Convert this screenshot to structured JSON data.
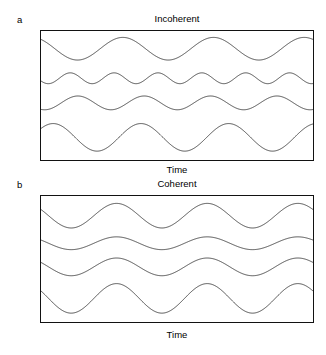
{
  "figure": {
    "background_color": "#ffffff",
    "stroke_color": "#4f4f4f",
    "border_color": "#121212"
  },
  "panels": [
    {
      "letter": "a",
      "title": "Incoherent",
      "xlabel": "Time"
    },
    {
      "letter": "b",
      "title": "Coherent",
      "xlabel": "Time"
    }
  ],
  "chart_data": [
    {
      "type": "line",
      "title": "Incoherent",
      "xlabel": "Time",
      "ylabel": "",
      "grid": false,
      "legend": "none",
      "xlim": [
        0,
        1
      ],
      "ylim": [
        0,
        1
      ],
      "description": "Four sinusoidal waves stacked vertically with differing wavelengths, amplitudes and phases so that their peaks are not aligned.",
      "series": [
        {
          "name": "wave-1",
          "cycles": 3.0,
          "amplitude": 11.5,
          "phase_deg": 125,
          "baseline_y": 18
        },
        {
          "name": "wave-2",
          "cycles": 6.2,
          "amplitude": 5.5,
          "phase_deg": 210,
          "baseline_y": 48
        },
        {
          "name": "wave-3",
          "cycles": 4.1,
          "amplitude": 7.0,
          "phase_deg": 250,
          "baseline_y": 73
        },
        {
          "name": "wave-4",
          "cycles": 3.1,
          "amplitude": 14.0,
          "phase_deg": 40,
          "baseline_y": 108
        }
      ]
    },
    {
      "type": "line",
      "title": "Coherent",
      "xlabel": "Time",
      "ylabel": "",
      "grid": false,
      "legend": "none",
      "xlim": [
        0,
        1
      ],
      "ylim": [
        0,
        1
      ],
      "description": "Four sinusoidal waves stacked vertically all sharing the same wavelength and phase so that their peaks line up in vertical register; amplitudes differ.",
      "series": [
        {
          "name": "wave-1",
          "cycles": 3.0,
          "amplitude": 12.5,
          "phase_deg": 150,
          "baseline_y": 20
        },
        {
          "name": "wave-2",
          "cycles": 3.0,
          "amplitude": 6.5,
          "phase_deg": 150,
          "baseline_y": 48
        },
        {
          "name": "wave-3",
          "cycles": 3.0,
          "amplitude": 9.0,
          "phase_deg": 150,
          "baseline_y": 72
        },
        {
          "name": "wave-4",
          "cycles": 3.0,
          "amplitude": 15.0,
          "phase_deg": 150,
          "baseline_y": 104
        }
      ]
    }
  ]
}
